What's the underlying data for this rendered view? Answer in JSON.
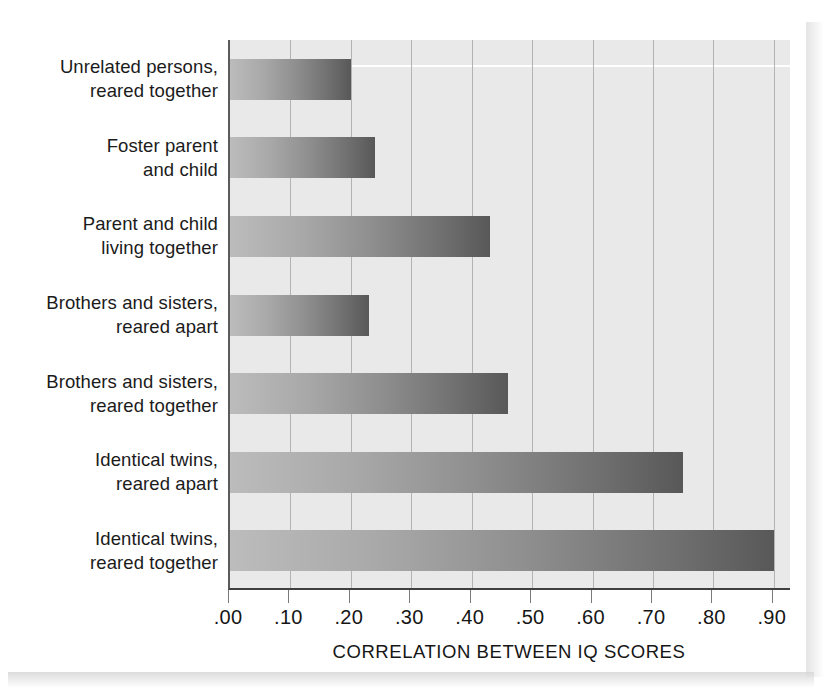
{
  "chart_data": {
    "type": "bar",
    "orientation": "horizontal",
    "title": "",
    "xlabel": "CORRELATION BETWEEN IQ SCORES",
    "ylabel": "",
    "categories": [
      "Unrelated persons,\nreared together",
      "Foster parent\nand child",
      "Parent and child\nliving together",
      "Brothers and sisters,\nreared apart",
      "Brothers and sisters,\nreared together",
      "Identical twins,\nreared apart",
      "Identical twins,\nreared together"
    ],
    "values": [
      0.2,
      0.24,
      0.43,
      0.23,
      0.46,
      0.75,
      0.9
    ],
    "xlim": [
      0.0,
      0.93
    ],
    "xticks": [
      0.0,
      0.1,
      0.2,
      0.3,
      0.4,
      0.5,
      0.6,
      0.7,
      0.8,
      0.9
    ],
    "xtick_labels": [
      ".00",
      ".10",
      ".20",
      ".30",
      ".40",
      ".50",
      ".60",
      ".70",
      ".80",
      ".90"
    ],
    "grid": "vertical",
    "legend": "none",
    "bar_gradient_from": "#bcbcbc",
    "bar_gradient_to": "#585858",
    "plot_background": "#e9e9e9",
    "gridline_color": "#b3b3b3",
    "axis_color": "#3f3f3f"
  },
  "labels": {
    "rows": [
      {
        "line1": "Unrelated persons,",
        "line2": "reared together"
      },
      {
        "line1": "Foster parent",
        "line2": "and child"
      },
      {
        "line1": "Parent and child",
        "line2": "living together"
      },
      {
        "line1": "Brothers and sisters,",
        "line2": "reared apart"
      },
      {
        "line1": "Brothers and sisters,",
        "line2": "reared together"
      },
      {
        "line1": "Identical twins,",
        "line2": "reared apart"
      },
      {
        "line1": "Identical twins,",
        "line2": "reared together"
      }
    ]
  },
  "axis": {
    "title": "CORRELATION BETWEEN IQ SCORES",
    "ticks": [
      ".00",
      ".10",
      ".20",
      ".30",
      ".40",
      ".50",
      ".60",
      ".70",
      ".80",
      ".90"
    ]
  }
}
